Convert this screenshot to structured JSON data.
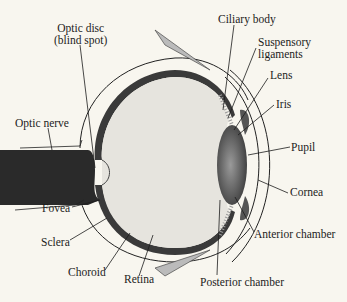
{
  "diagram": {
    "labels": {
      "optic_disc_line1": "Optic disc",
      "optic_disc_line2": "(blind spot)",
      "optic_nerve": "Optic nerve",
      "fovea": "Fovea",
      "sclera": "Sclera",
      "choroid": "Choroid",
      "retina": "Retina",
      "ciliary_body": "Ciliary body",
      "suspensory_line1": "Suspensory",
      "suspensory_line2": "ligaments",
      "lens": "Lens",
      "iris": "Iris",
      "pupil": "Pupil",
      "cornea": "Cornea",
      "anterior_chamber": "Anterior chamber",
      "posterior_chamber": "Posterior chamber"
    },
    "colors": {
      "background": "#f8f6ef",
      "vitreous": "#e6e4de",
      "choroid": "#3a3a3a",
      "retina": "#8a8a8a",
      "lens": "#6a6a6a",
      "nerve": "#2a2a2a",
      "ink": "#1c1c1c"
    }
  }
}
